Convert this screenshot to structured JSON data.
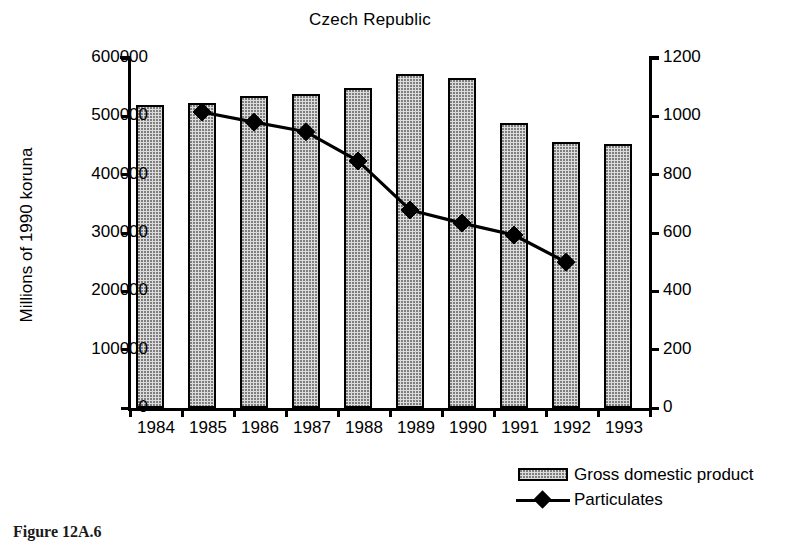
{
  "figure": {
    "caption": "Figure 12A.6"
  },
  "chart_data": {
    "type": "bar",
    "title": "Czech Republic",
    "xlabel": "",
    "ylabel": "Millions of 1990 koruna",
    "y2label": "1000s of metric tons particulates",
    "categories": [
      "1984",
      "1985",
      "1986",
      "1987",
      "1988",
      "1989",
      "1990",
      "1991",
      "1992",
      "1993"
    ],
    "ylim": [
      0,
      600000
    ],
    "yticks": [
      "0",
      "100000",
      "200000",
      "300000",
      "400000",
      "500000",
      "600000"
    ],
    "ytick_values": [
      0,
      100000,
      200000,
      300000,
      400000,
      500000,
      600000
    ],
    "y2lim": [
      0,
      1200
    ],
    "y2ticks": [
      "0",
      "200",
      "400",
      "600",
      "800",
      "1000",
      "1200"
    ],
    "y2tick_values": [
      0,
      200,
      400,
      600,
      800,
      1000,
      1200
    ],
    "grid": false,
    "legend_position": "bottom-right",
    "series": [
      {
        "name": "Gross domestic product",
        "kind": "bar",
        "axis": "left",
        "fill": "#dcdcdc",
        "edge": "#000000",
        "values": [
          520000,
          523000,
          535000,
          538000,
          548000,
          573000,
          566000,
          488000,
          456000,
          453000
        ]
      },
      {
        "name": "Particulates",
        "kind": "line",
        "axis": "right",
        "marker": "diamond",
        "color": "#000000",
        "x": [
          "1985",
          "1986",
          "1987",
          "1988",
          "1989",
          "1990",
          "1991",
          "1992"
        ],
        "values": [
          1015,
          980,
          947,
          847,
          679,
          634,
          593,
          500
        ]
      }
    ]
  },
  "legend": {
    "items": [
      {
        "label": "Gross domestic product",
        "swatch": "bar-swatch"
      },
      {
        "label": "Particulates",
        "swatch": "line-diamond-swatch"
      }
    ]
  },
  "colors": {
    "bar_fill": "#dcdcdc",
    "bar_edge": "#000000",
    "line": "#000000",
    "background": "#ffffff",
    "text": "#000000"
  }
}
